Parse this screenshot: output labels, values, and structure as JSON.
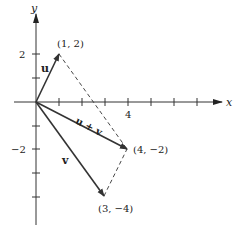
{
  "diagram": {
    "type": "vector-addition-parallelogram",
    "axes": {
      "x_label": "x",
      "y_label": "y",
      "x_tick_labels": [
        {
          "value": 4,
          "text": "4"
        }
      ],
      "y_tick_labels": [
        {
          "value": 2,
          "text": "2"
        },
        {
          "value": -2,
          "text": "−2"
        }
      ]
    },
    "vectors": [
      {
        "name": "u",
        "label": "u",
        "from": [
          0,
          0
        ],
        "to": [
          1,
          2
        ]
      },
      {
        "name": "v",
        "label": "v",
        "from": [
          0,
          0
        ],
        "to": [
          3,
          -4
        ]
      },
      {
        "name": "u_plus_v",
        "label": "u + v",
        "from": [
          0,
          0
        ],
        "to": [
          4,
          -2
        ]
      }
    ],
    "points": [
      {
        "coord": [
          1,
          2
        ],
        "text": "(1, 2)"
      },
      {
        "coord": [
          4,
          -2
        ],
        "text": "(4, −2)"
      },
      {
        "coord": [
          3,
          -4
        ],
        "text": "(3, −4)"
      }
    ],
    "dashed_edges": [
      {
        "from": [
          1,
          2
        ],
        "to": [
          4,
          -2
        ]
      },
      {
        "from": [
          3,
          -4
        ],
        "to": [
          4,
          -2
        ]
      }
    ],
    "colors": {
      "stroke": "#333333",
      "background": "#ffffff"
    }
  }
}
